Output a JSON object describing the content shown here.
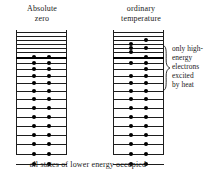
{
  "figure": {
    "caption": "all states of lower energy occupied",
    "ink_color": "#1d1d1d",
    "background_color": "#ffffff"
  },
  "columns": [
    {
      "id": "absolute-zero",
      "title": "Absolute\nzero",
      "dot_count": 28
    },
    {
      "id": "ordinary-temperature",
      "title": "ordinary\ntemperature",
      "dot_count": 28
    }
  ],
  "annotation": {
    "text": "only high-\nenergy\nelectrons\nexcited\nby heat",
    "brace": "right-curly-brace"
  },
  "chart_data": {
    "type": "diagram",
    "level_count": 20,
    "fermi_level_index": 6,
    "y_axis": "energy (increasing upward)",
    "panels": [
      {
        "name": "Absolute zero",
        "levels": [
          {
            "index": 0,
            "y": 2,
            "thick": false,
            "dots": []
          },
          {
            "index": 1,
            "y": 6,
            "thick": false,
            "dots": []
          },
          {
            "index": 2,
            "y": 10,
            "thick": false,
            "dots": []
          },
          {
            "index": 3,
            "y": 14,
            "thick": false,
            "dots": []
          },
          {
            "index": 4,
            "y": 18,
            "thick": false,
            "dots": []
          },
          {
            "index": 5,
            "y": 22,
            "thick": false,
            "dots": []
          },
          {
            "index": 6,
            "y": 27,
            "thick": true,
            "dots": [
              18,
              33
            ]
          },
          {
            "index": 7,
            "y": 33,
            "thick": false,
            "dots": [
              18,
              33
            ]
          },
          {
            "index": 8,
            "y": 39,
            "thick": false,
            "dots": [
              18,
              33
            ]
          },
          {
            "index": 9,
            "y": 46,
            "thick": false,
            "dots": [
              18,
              33
            ]
          },
          {
            "index": 10,
            "y": 53,
            "thick": false,
            "dots": [
              18,
              33
            ]
          },
          {
            "index": 11,
            "y": 61,
            "thick": false,
            "dots": [
              18,
              33
            ]
          },
          {
            "index": 12,
            "y": 69,
            "thick": false,
            "dots": [
              18,
              33
            ]
          },
          {
            "index": 13,
            "y": 78,
            "thick": false,
            "dots": [
              18,
              33
            ]
          },
          {
            "index": 14,
            "y": 87,
            "thick": false,
            "dots": [
              18,
              33
            ]
          },
          {
            "index": 15,
            "y": 96,
            "thick": false,
            "dots": [
              18,
              33
            ]
          },
          {
            "index": 16,
            "y": 105,
            "thick": false,
            "dots": [
              18,
              33
            ]
          },
          {
            "index": 17,
            "y": 114,
            "thick": false,
            "dots": [
              18,
              33
            ]
          },
          {
            "index": 18,
            "y": 124,
            "thick": false,
            "dots": [
              18,
              33
            ]
          },
          {
            "index": 19,
            "y": 134,
            "thick": false,
            "dots": [
              18,
              33
            ]
          }
        ]
      },
      {
        "name": "ordinary temperature",
        "levels": [
          {
            "index": 0,
            "y": 2,
            "thick": false,
            "dots": []
          },
          {
            "index": 1,
            "y": 6,
            "thick": false,
            "dots": []
          },
          {
            "index": 2,
            "y": 10,
            "thick": false,
            "dots": [
              33
            ]
          },
          {
            "index": 3,
            "y": 14,
            "thick": false,
            "dots": [
              18
            ]
          },
          {
            "index": 4,
            "y": 18,
            "thick": false,
            "dots": [
              18,
              33
            ]
          },
          {
            "index": 5,
            "y": 22,
            "thick": false,
            "dots": [
              18
            ]
          },
          {
            "index": 6,
            "y": 27,
            "thick": true,
            "dots": [
              33
            ]
          },
          {
            "index": 7,
            "y": 33,
            "thick": false,
            "dots": [
              18,
              33
            ]
          },
          {
            "index": 8,
            "y": 39,
            "thick": false,
            "dots": [
              33
            ]
          },
          {
            "index": 9,
            "y": 46,
            "thick": false,
            "dots": [
              18,
              33
            ]
          },
          {
            "index": 10,
            "y": 53,
            "thick": false,
            "dots": [
              18,
              33
            ]
          },
          {
            "index": 11,
            "y": 61,
            "thick": false,
            "dots": [
              18,
              33
            ]
          },
          {
            "index": 12,
            "y": 69,
            "thick": false,
            "dots": [
              18,
              33
            ]
          },
          {
            "index": 13,
            "y": 78,
            "thick": false,
            "dots": [
              18,
              33
            ]
          },
          {
            "index": 14,
            "y": 87,
            "thick": false,
            "dots": [
              18,
              33
            ]
          },
          {
            "index": 15,
            "y": 96,
            "thick": false,
            "dots": [
              18,
              33
            ]
          },
          {
            "index": 16,
            "y": 105,
            "thick": false,
            "dots": [
              18,
              33
            ]
          },
          {
            "index": 17,
            "y": 114,
            "thick": false,
            "dots": [
              18,
              33
            ]
          },
          {
            "index": 18,
            "y": 124,
            "thick": false,
            "dots": [
              18,
              33
            ]
          },
          {
            "index": 19,
            "y": 134,
            "thick": false,
            "dots": [
              18,
              33
            ]
          }
        ]
      }
    ]
  }
}
